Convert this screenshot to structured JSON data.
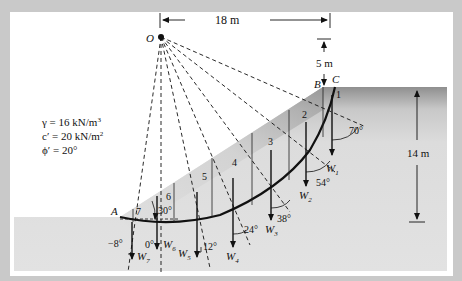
{
  "figure": {
    "type": "slope-stability-method-of-slices",
    "center_label": "O",
    "points": {
      "A": "A",
      "B": "B",
      "C": "C"
    },
    "dimensions": {
      "horizontal": "18 m",
      "vertical_top": "5 m",
      "height": "14 m"
    },
    "soil_properties": {
      "gamma": "γ = 16 kN/m",
      "gamma_exp": "3",
      "c": "c′ = 20 kN/m",
      "c_exp": "2",
      "phi": "ϕ′ = 20°"
    },
    "slices": [
      {
        "number": "1",
        "weight": "W",
        "sub": "1",
        "angle": "70°"
      },
      {
        "number": "2",
        "weight": "W",
        "sub": "2",
        "angle": "54°"
      },
      {
        "number": "3",
        "weight": "W",
        "sub": "3",
        "angle": "38°"
      },
      {
        "number": "4",
        "weight": "W",
        "sub": "4",
        "angle": "24°"
      },
      {
        "number": "5",
        "weight": "W",
        "sub": "5",
        "angle": "12°"
      },
      {
        "number": "6",
        "weight": "W",
        "sub": "6",
        "angle": "0°"
      },
      {
        "number": "7",
        "weight": "W",
        "sub": "7",
        "angle": "−8°"
      }
    ],
    "slope_angle": "30°",
    "colors": {
      "frame": "#c9c9c9",
      "panel": "#ffffff",
      "ground": "#dedede",
      "ground_top": "#9a9a9a",
      "line": "#111111"
    }
  }
}
